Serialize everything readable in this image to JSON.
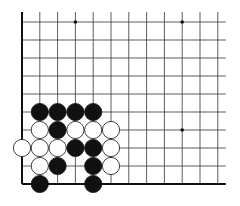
{
  "board": {
    "origin_x": 22,
    "origin_y": 22,
    "spacing_x": 17.8,
    "spacing_y": 18,
    "cols": 12,
    "rows": 10,
    "line_color": "#333333",
    "edge_color": "#111111",
    "star_points": [
      [
        3,
        0
      ],
      [
        9,
        0
      ],
      [
        9,
        6
      ]
    ],
    "stones": [
      {
        "c": 1,
        "r": 5,
        "color": "black"
      },
      {
        "c": 2,
        "r": 5,
        "color": "black"
      },
      {
        "c": 3,
        "r": 5,
        "color": "black"
      },
      {
        "c": 4,
        "r": 5,
        "color": "black"
      },
      {
        "c": 1,
        "r": 6,
        "color": "white"
      },
      {
        "c": 2,
        "r": 6,
        "color": "black"
      },
      {
        "c": 3,
        "r": 6,
        "color": "white"
      },
      {
        "c": 4,
        "r": 6,
        "color": "white"
      },
      {
        "c": 5,
        "r": 6,
        "color": "white"
      },
      {
        "c": 0,
        "r": 7,
        "color": "white"
      },
      {
        "c": 1,
        "r": 7,
        "color": "white"
      },
      {
        "c": 2,
        "r": 7,
        "color": "white"
      },
      {
        "c": 3,
        "r": 7,
        "color": "black"
      },
      {
        "c": 4,
        "r": 7,
        "color": "black"
      },
      {
        "c": 5,
        "r": 7,
        "color": "white"
      },
      {
        "c": 1,
        "r": 8,
        "color": "white"
      },
      {
        "c": 2,
        "r": 8,
        "color": "black"
      },
      {
        "c": 4,
        "r": 8,
        "color": "black"
      },
      {
        "c": 5,
        "r": 8,
        "color": "white"
      },
      {
        "c": 1,
        "r": 9,
        "color": "black"
      },
      {
        "c": 4,
        "r": 9,
        "color": "black"
      }
    ]
  }
}
